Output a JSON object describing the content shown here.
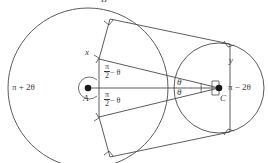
{
  "figure": {
    "kind": "geometry-diagram",
    "stroke_color": "#4a4a4a",
    "text_color": "#3a3a3a",
    "background": "#ffffff"
  },
  "labels": {
    "top_partial": "B",
    "left_angle": "π + 2θ",
    "right_angle": "π − 2θ",
    "point_a": "A",
    "point_c": "C",
    "chord_x": "x",
    "chord_y": "y",
    "angle_upper_num": "π",
    "angle_upper_den": "2",
    "angle_upper_rest": "− θ",
    "angle_lower_num": "π",
    "angle_lower_den": "2",
    "angle_lower_rest": "− θ",
    "theta_upper": "θ",
    "theta_lower": "θ"
  },
  "geometry": {
    "circle_a": {
      "cx": 88,
      "cy": 88,
      "r": 80
    },
    "circle_c": {
      "cx": 219,
      "cy": 88,
      "r": 45
    },
    "center_line": {
      "x1": 88,
      "y1": 88,
      "x2": 219,
      "y2": 88
    },
    "tangent_points": [
      {
        "name": "upper-left-tangent",
        "x": 110,
        "y": 19
      },
      {
        "name": "lower-left-tangent",
        "x": 110,
        "y": 157
      },
      {
        "name": "upper-right-tangent",
        "x": 230,
        "y": 44
      },
      {
        "name": "lower-right-tangent",
        "x": 230,
        "y": 132
      },
      {
        "name": "chord-x-upper",
        "x": 99,
        "y": 59
      },
      {
        "name": "chord-x-lower",
        "x": 99,
        "y": 117
      }
    ]
  }
}
